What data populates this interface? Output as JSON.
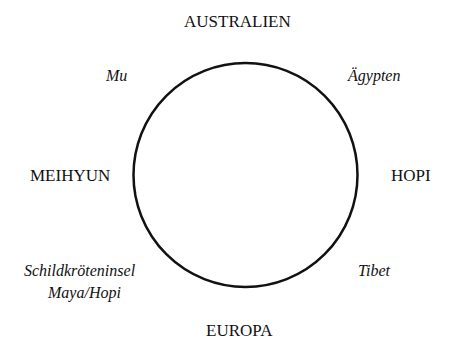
{
  "diagram": {
    "circle": {
      "cx": 245.5,
      "cy": 175,
      "r": 112,
      "stroke": "#111111"
    },
    "cardinal": {
      "top": "AUSTRALIEN",
      "right": "HOPI",
      "bottom": "EUROPA",
      "left": "MEIHYUN"
    },
    "intercardinal": {
      "top_left": "Mu",
      "top_right": "Ägypten",
      "bottom_right": "Tibet",
      "bottom_left_line1": "Schildkröteninsel",
      "bottom_left_line2": "Maya/Hopi"
    }
  }
}
